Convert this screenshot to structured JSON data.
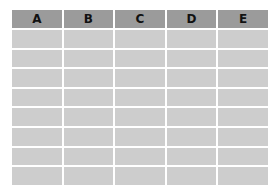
{
  "table": {
    "columns": [
      "A",
      "B",
      "C",
      "D",
      "E"
    ],
    "rows": [
      [
        "",
        "",
        "",
        "",
        ""
      ],
      [
        "",
        "",
        "",
        "",
        ""
      ],
      [
        "",
        "",
        "",
        "",
        ""
      ],
      [
        "",
        "",
        "",
        "",
        ""
      ],
      [
        "",
        "",
        "",
        "",
        ""
      ],
      [
        "",
        "",
        "",
        "",
        ""
      ],
      [
        "",
        "",
        "",
        "",
        ""
      ],
      [
        "",
        "",
        "",
        "",
        ""
      ]
    ],
    "colors": {
      "header_bg": "#9b9b9b",
      "cell_bg": "#cdcdcd",
      "gridline": "#ffffff"
    }
  }
}
